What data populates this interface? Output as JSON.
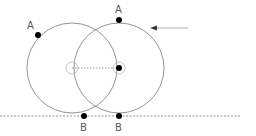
{
  "diagram": {
    "colors": {
      "circle_stroke": "#888888",
      "center_marker": "#bbbbbb",
      "point_fill": "#000000",
      "ground_line": "#777777",
      "arrow": "#999999",
      "label": "#555555"
    },
    "circles": [
      {
        "id": "circle-initial",
        "cx": 72,
        "cy": 68,
        "r": 45
      },
      {
        "id": "circle-displaced",
        "cx": 119,
        "cy": 68,
        "r": 45
      }
    ],
    "points": [
      {
        "id": "point-a-initial",
        "label": "A",
        "x": 38,
        "y": 35,
        "label_x": 27,
        "label_y": 29
      },
      {
        "id": "point-a-displaced",
        "label": "A",
        "x": 119,
        "y": 20,
        "label_x": 115,
        "label_y": 13
      },
      {
        "id": "point-b-initial",
        "label": "B",
        "x": 84,
        "y": 116,
        "label_x": 80,
        "label_y": 131
      },
      {
        "id": "point-b-displaced",
        "label": "B",
        "x": 119,
        "y": 116,
        "label_x": 115,
        "label_y": 131
      }
    ],
    "labels": {
      "a1": "A",
      "a2": "A",
      "b1": "B",
      "b2": "B"
    },
    "ground_line": {
      "x1": 0,
      "x2": 240,
      "y": 116
    },
    "arrow": {
      "x1": 188,
      "y1": 28,
      "x2": 150,
      "y2": 28
    }
  }
}
